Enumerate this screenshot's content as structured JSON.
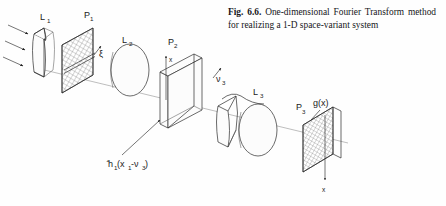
{
  "figure": {
    "caption_number": "Fig. 6.6.",
    "caption_text": "One-dimensional Fourier Transform method for realizing a 1-D space-variant system"
  },
  "diagram": {
    "type": "optical-setup-schematic",
    "background_color": "#fefefe",
    "ink_color": "#1a1a1a",
    "axis_color": "#9a9a9a",
    "labels": {
      "lens1": "L",
      "lens1_sub": "1",
      "plane1": "P",
      "plane1_sub": "1",
      "xi": "ξ",
      "lens2": "L",
      "lens2_sub": "2",
      "plane2": "P",
      "plane2_sub": "2",
      "plane2_axis": "x",
      "nu3": "ν",
      "nu3_sub": "3",
      "lens3": "L",
      "lens3_sub": "3",
      "plane3": "P",
      "plane3_sub": "3",
      "output_function": "g(x)",
      "output_axis": "x",
      "mask_function_hat": "h",
      "mask_function_sub": "1",
      "mask_function_arg": "(x",
      "mask_function_arg_sub": "1",
      "mask_function_arg_tail": "-ν",
      "mask_function_arg_tail_sub": "3",
      "mask_function_close": ")"
    },
    "elements": [
      {
        "name": "input-beam-arrows",
        "count": 3,
        "kind": "arrow"
      },
      {
        "name": "cylindrical-lens-L1",
        "kind": "block-lens"
      },
      {
        "name": "hatched-plane-P1",
        "kind": "hatched-plane-with-slit"
      },
      {
        "name": "spherical-lens-L2",
        "kind": "ellipse-lens"
      },
      {
        "name": "clear-plane-P2",
        "kind": "clear-slab"
      },
      {
        "name": "cylindrical-lens-L3a",
        "kind": "block-lens"
      },
      {
        "name": "spherical-lens-L3b",
        "kind": "ellipse-lens"
      },
      {
        "name": "hatched-plane-P3",
        "kind": "hatched-plane"
      },
      {
        "name": "optical-axis",
        "kind": "line"
      }
    ]
  }
}
